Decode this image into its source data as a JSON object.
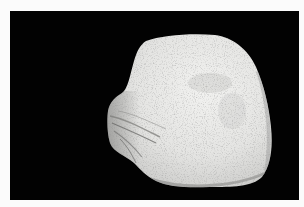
{
  "image": {
    "subject": "white rock specimen",
    "caption": "Photograph of a pale, rough-textured rock on a black background",
    "background_color": "#020202",
    "border_color": "#fbfbfb",
    "rock_color": "#e6e6e4"
  }
}
